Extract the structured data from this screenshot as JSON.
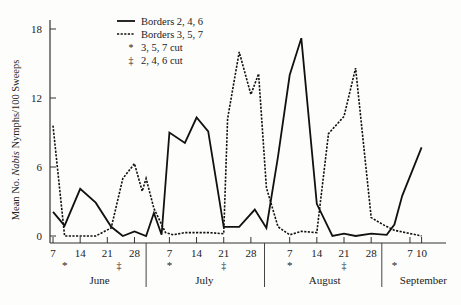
{
  "chart_data": {
    "type": "line",
    "title": "",
    "xlabel": "",
    "ylabel": "Mean No. Nabis Nymphs/100 Sweeps",
    "ylabel_parts": {
      "pre": "Mean No. ",
      "italic": "Nabis",
      "post": " Nymphs/100 Sweeps"
    },
    "ylim": [
      0,
      18
    ],
    "yticks": [
      0,
      6,
      12,
      18
    ],
    "grid": false,
    "legend_position": "upper-left-inside",
    "legend": [
      {
        "label": "Borders 2, 4, 6",
        "style": "solid"
      },
      {
        "label": "Borders 3, 5, 7",
        "style": "dashed"
      },
      {
        "label": "3, 5, 7 cut",
        "marker": "*"
      },
      {
        "label": "2, 4, 6 cut",
        "marker": "‡"
      }
    ],
    "months": [
      {
        "name": "June",
        "ticks": [
          "7",
          "14",
          "21",
          "28"
        ]
      },
      {
        "name": "July",
        "ticks": [
          "7",
          "14",
          "21",
          "28"
        ]
      },
      {
        "name": "August",
        "ticks": [
          "7",
          "14",
          "21",
          "28"
        ]
      },
      {
        "name": "September",
        "ticks": [
          "7",
          "10"
        ]
      }
    ],
    "x_day_index_note": "x = day offset from June 7",
    "xtick_days": [
      0,
      7,
      14,
      21,
      30,
      37,
      44,
      51,
      61,
      68,
      75,
      82,
      92,
      95
    ],
    "xtick_labels": [
      "7",
      "14",
      "21",
      "28",
      "7",
      "14",
      "21",
      "28",
      "7",
      "14",
      "21",
      "28",
      "7",
      "10"
    ],
    "month_dividers_days": [
      24,
      54,
      85
    ],
    "cut_markers": [
      {
        "day": 3,
        "marker": "*",
        "label": "3, 5, 7 cut"
      },
      {
        "day": 17,
        "marker": "‡",
        "label": "2, 4, 6 cut"
      },
      {
        "day": 30,
        "marker": "*",
        "label": "3, 5, 7 cut"
      },
      {
        "day": 44,
        "marker": "‡",
        "label": "2, 4, 6 cut"
      },
      {
        "day": 61,
        "marker": "*",
        "label": "3, 5, 7 cut"
      },
      {
        "day": 75,
        "marker": "‡",
        "label": "2, 4, 6 cut"
      },
      {
        "day": 88,
        "marker": "*",
        "label": "3, 5, 7 cut"
      }
    ],
    "series": [
      {
        "name": "Borders 2, 4, 6",
        "style": "solid",
        "x": [
          0,
          3,
          7,
          11,
          15,
          18,
          21,
          24,
          26,
          28,
          30,
          34,
          37,
          40,
          44,
          48,
          52,
          55,
          58,
          61,
          64,
          68,
          72,
          75,
          78,
          82,
          86,
          88,
          90,
          95
        ],
        "y": [
          2.1,
          0.9,
          4.1,
          2.9,
          0.8,
          0.0,
          0.4,
          0.0,
          2.0,
          0.1,
          9.0,
          8.1,
          10.3,
          9.1,
          0.8,
          0.8,
          2.3,
          0.7,
          6.9,
          14.0,
          17.2,
          2.8,
          0.0,
          0.2,
          0.0,
          0.2,
          0.1,
          1.0,
          3.5,
          7.7
        ]
      },
      {
        "name": "Borders 3, 5, 7",
        "style": "dashed",
        "x": [
          0,
          3,
          7,
          11,
          15,
          18,
          21,
          23,
          24,
          26,
          29,
          31,
          34,
          37,
          40,
          44,
          45,
          48,
          51,
          53,
          55,
          58,
          61,
          64,
          68,
          71,
          75,
          78,
          82,
          85,
          88,
          95
        ],
        "y": [
          9.6,
          0.0,
          0.0,
          0.0,
          0.7,
          5.0,
          6.3,
          3.9,
          5.0,
          2.4,
          0.3,
          0.1,
          0.3,
          0.3,
          0.3,
          0.2,
          10.2,
          16.0,
          12.3,
          14.1,
          4.2,
          0.8,
          0.1,
          0.4,
          0.3,
          8.9,
          10.4,
          14.6,
          1.6,
          1.0,
          0.5,
          0.0
        ]
      }
    ]
  }
}
